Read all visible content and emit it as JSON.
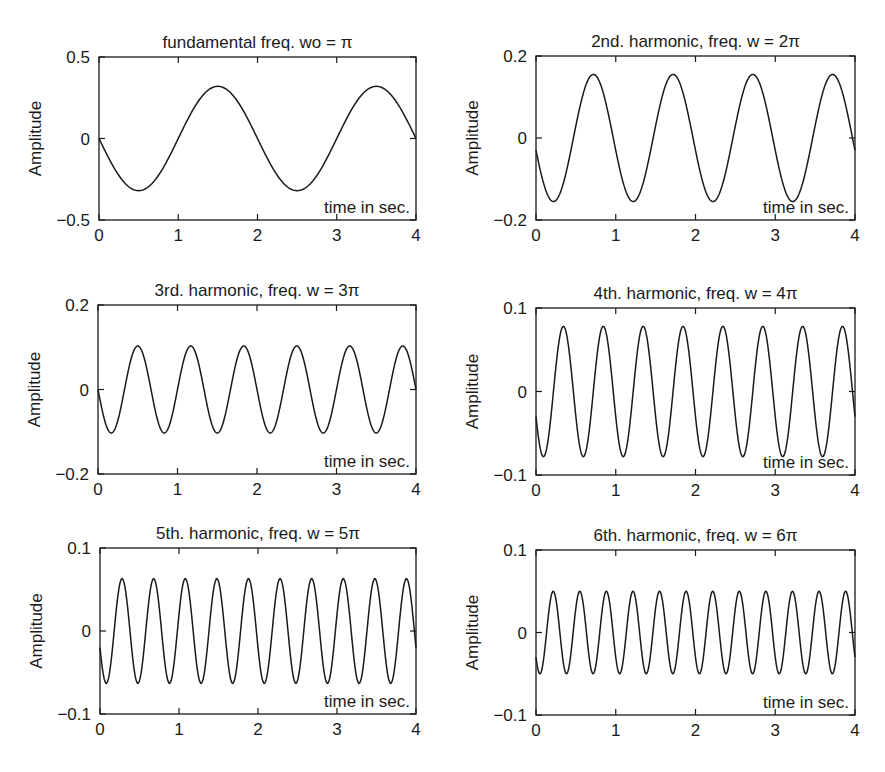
{
  "chart_data": [
    {
      "type": "line",
      "title": "fundamental freq. wo = π",
      "xlabel": "time in sec.",
      "ylabel": "Amplitude",
      "xlim": [
        0,
        4
      ],
      "ylim": [
        -0.5,
        0.5
      ],
      "xticks": [
        "0",
        "1",
        "2",
        "3",
        "4"
      ],
      "yticks": [
        "-0.5",
        "0",
        "0.5"
      ],
      "ytick_values": [
        -0.5,
        0,
        0.5
      ],
      "grid": false,
      "series": [
        {
          "name": "fundamental",
          "frequency_rad_per_s": "π",
          "harmonic": 1,
          "amplitude": 0.32,
          "start_value": 0.0,
          "x": [
            0,
            0.5,
            1,
            1.5,
            2,
            2.5,
            3,
            3.5,
            4
          ],
          "values": [
            0,
            -0.32,
            0,
            0.33,
            0,
            -0.32,
            0,
            0.32,
            0.02
          ]
        }
      ],
      "box": {
        "left": 99,
        "top": 57,
        "right": 416,
        "bottom": 220
      }
    },
    {
      "type": "line",
      "title": "2nd. harmonic, freq. w = 2π",
      "xlabel": "time in sec.",
      "ylabel": "Amplitude",
      "xlim": [
        0,
        4
      ],
      "ylim": [
        -0.2,
        0.2
      ],
      "xticks": [
        "0",
        "1",
        "2",
        "3",
        "4"
      ],
      "yticks": [
        "-0.2",
        "0",
        "0.2"
      ],
      "ytick_values": [
        -0.2,
        0,
        0.2
      ],
      "grid": false,
      "series": [
        {
          "name": "2nd harmonic",
          "frequency_rad_per_s": "2π",
          "harmonic": 2,
          "amplitude": 0.155,
          "start_value": -0.03,
          "x": [
            0,
            0.25,
            0.75,
            1.25,
            1.75,
            2.25,
            2.75,
            3.25,
            3.75,
            4
          ],
          "values": [
            -0.03,
            -0.155,
            0.155,
            -0.155,
            0.155,
            -0.155,
            0.155,
            -0.155,
            0.155,
            0.0
          ]
        }
      ],
      "box": {
        "left": 536,
        "top": 56,
        "right": 855,
        "bottom": 220
      }
    },
    {
      "type": "line",
      "title": "3rd. harmonic, freq. w = 3π",
      "xlabel": "time in sec.",
      "ylabel": "Amplitude",
      "xlim": [
        0,
        4
      ],
      "ylim": [
        -0.2,
        0.2
      ],
      "xticks": [
        "0",
        "1",
        "2",
        "3",
        "4"
      ],
      "yticks": [
        "-0.2",
        "0",
        "0.2"
      ],
      "ytick_values": [
        -0.2,
        0,
        0.2
      ],
      "grid": false,
      "series": [
        {
          "name": "3rd harmonic",
          "frequency_rad_per_s": "3π",
          "harmonic": 3,
          "amplitude": 0.103,
          "start_value": 0.0,
          "x": [
            0,
            0.17,
            0.5,
            0.83,
            1.17,
            1.5,
            1.83,
            2.17,
            2.5,
            2.83,
            3.17,
            3.5,
            3.83,
            4
          ],
          "values": [
            0,
            -0.103,
            0.103,
            -0.103,
            0.103,
            -0.103,
            0.103,
            -0.103,
            0.103,
            -0.103,
            0.103,
            -0.103,
            0.103,
            0
          ]
        }
      ],
      "box": {
        "left": 98,
        "top": 305,
        "right": 416,
        "bottom": 474
      }
    },
    {
      "type": "line",
      "title": "4th. harmonic, freq. w = 4π",
      "xlabel": "time in sec.",
      "ylabel": "Amplitude",
      "xlim": [
        0,
        4
      ],
      "ylim": [
        -0.1,
        0.1
      ],
      "xticks": [
        "0",
        "1",
        "2",
        "3",
        "4"
      ],
      "yticks": [
        "-0.1",
        "0",
        "0.1"
      ],
      "ytick_values": [
        -0.1,
        0,
        0.1
      ],
      "grid": false,
      "series": [
        {
          "name": "4th harmonic",
          "frequency_rad_per_s": "4π",
          "harmonic": 4,
          "amplitude": 0.078,
          "start_value": -0.03,
          "x": [
            0,
            0.12,
            0.38,
            0.62,
            0.88,
            1.12,
            1.38,
            1.62,
            1.88,
            2.12,
            2.38,
            2.62,
            2.88,
            3.12,
            3.38,
            3.62,
            3.88,
            4
          ],
          "values": [
            -0.03,
            -0.078,
            0.078,
            -0.078,
            0.078,
            -0.078,
            0.078,
            -0.078,
            0.078,
            -0.078,
            0.078,
            -0.078,
            0.078,
            -0.078,
            0.078,
            -0.078,
            0.078,
            0.0
          ]
        }
      ],
      "box": {
        "left": 536,
        "top": 308,
        "right": 855,
        "bottom": 475
      }
    },
    {
      "type": "line",
      "title": "5th. harmonic, freq. w = 5π",
      "xlabel": "time in sec.",
      "ylabel": "Amplitude",
      "xlim": [
        0,
        4
      ],
      "ylim": [
        -0.1,
        0.1
      ],
      "xticks": [
        "0",
        "1",
        "2",
        "3",
        "4"
      ],
      "yticks": [
        "-0.1",
        "0",
        "0.1"
      ],
      "ytick_values": [
        -0.1,
        0,
        0.1
      ],
      "grid": false,
      "series": [
        {
          "name": "5th harmonic",
          "frequency_rad_per_s": "5π",
          "harmonic": 5,
          "amplitude": 0.063,
          "start_value": -0.02,
          "x": [
            0,
            0.1,
            0.3,
            0.5,
            0.7,
            0.9,
            1.1,
            1.3,
            1.5,
            1.7,
            1.9,
            2.1,
            2.3,
            2.5,
            2.7,
            2.9,
            3.1,
            3.3,
            3.5,
            3.7,
            3.9,
            4
          ],
          "values": [
            -0.02,
            -0.063,
            0.063,
            -0.063,
            0.063,
            -0.063,
            0.063,
            -0.063,
            0.063,
            -0.063,
            0.063,
            -0.063,
            0.063,
            -0.063,
            0.063,
            -0.063,
            0.063,
            -0.063,
            0.063,
            -0.063,
            0.063,
            0.0
          ]
        }
      ],
      "box": {
        "left": 100,
        "top": 548,
        "right": 416,
        "bottom": 714
      }
    },
    {
      "type": "line",
      "title": "6th. harmonic, freq. w = 6π",
      "xlabel": "time in sec.",
      "ylabel": "Amplitude",
      "xlim": [
        0,
        4
      ],
      "ylim": [
        -0.1,
        0.1
      ],
      "xticks": [
        "0",
        "1",
        "2",
        "3",
        "4"
      ],
      "yticks": [
        "-0.1",
        "0",
        "0.1"
      ],
      "ytick_values": [
        -0.1,
        0,
        0.1
      ],
      "grid": false,
      "series": [
        {
          "name": "6th harmonic",
          "frequency_rad_per_s": "6π",
          "harmonic": 6,
          "amplitude": 0.05,
          "start_value": -0.03,
          "x": [
            0,
            0.08,
            0.25,
            0.42,
            0.58,
            0.75,
            0.92,
            1.08,
            1.25,
            1.42,
            1.58,
            1.75,
            1.92,
            2.08,
            2.25,
            2.42,
            2.58,
            2.75,
            2.92,
            3.08,
            3.25,
            3.42,
            3.58,
            3.75,
            3.92,
            4
          ],
          "values": [
            -0.03,
            -0.05,
            0.05,
            -0.05,
            0.05,
            -0.05,
            0.05,
            -0.05,
            0.05,
            -0.05,
            0.05,
            -0.05,
            0.05,
            -0.05,
            0.05,
            -0.05,
            0.05,
            -0.05,
            0.05,
            -0.05,
            0.05,
            -0.05,
            0.05,
            -0.05,
            0.05,
            0.0
          ]
        }
      ],
      "box": {
        "left": 536,
        "top": 550,
        "right": 855,
        "bottom": 715
      }
    }
  ],
  "style": {
    "line_color": "#1a1a1a",
    "axis_color": "#1a1a1a",
    "background": "#ffffff"
  }
}
